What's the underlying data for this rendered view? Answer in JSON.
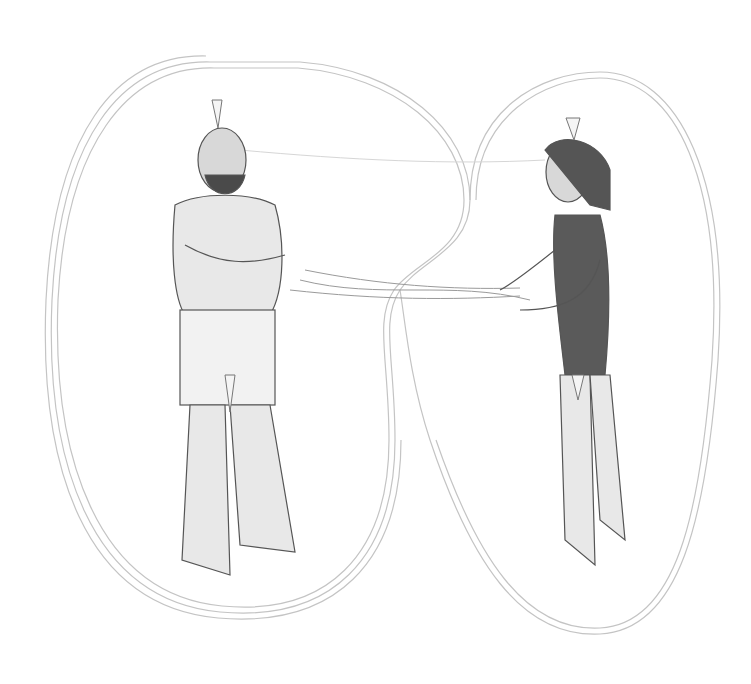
{
  "image": {
    "kind": "pencil illustration",
    "description": "Two standing figures inside connected aura outlines; bearded man in shorts with arms crossed on the left, woman in swimsuit gesturing on the right; energy strands flow between them",
    "figures": [
      {
        "id": "man",
        "position": "left",
        "pose": "arms crossed"
      },
      {
        "id": "woman",
        "position": "right",
        "pose": "hands extended"
      }
    ],
    "colors": {
      "background": "#ffffff",
      "line": "#8a8a8a",
      "shade": "#5a5a5a",
      "aura": "#c8c8c8"
    }
  }
}
